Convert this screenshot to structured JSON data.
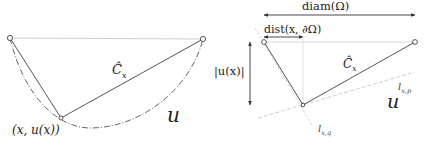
{
  "left_panel": {
    "curve_label": "Ĉ",
    "curve_label_sub": "x",
    "set_label": "u",
    "point_label": "(x, u(x))"
  },
  "right_panel": {
    "diam_label": "diam(Ω)",
    "dist_label": "dist(x, ∂Ω)",
    "height_label": "|u(x)|",
    "curve_label": "Ĉ",
    "curve_label_sub": "x",
    "set_label": "u",
    "line_p_label": "l",
    "line_p_sub": "x,p",
    "line_q_label": "l",
    "line_q_sub": "x,q"
  },
  "colors": {
    "stroke": "#555555",
    "light_stroke": "#cccccc",
    "dashed": "#d0d0d0",
    "text": "#222222"
  }
}
